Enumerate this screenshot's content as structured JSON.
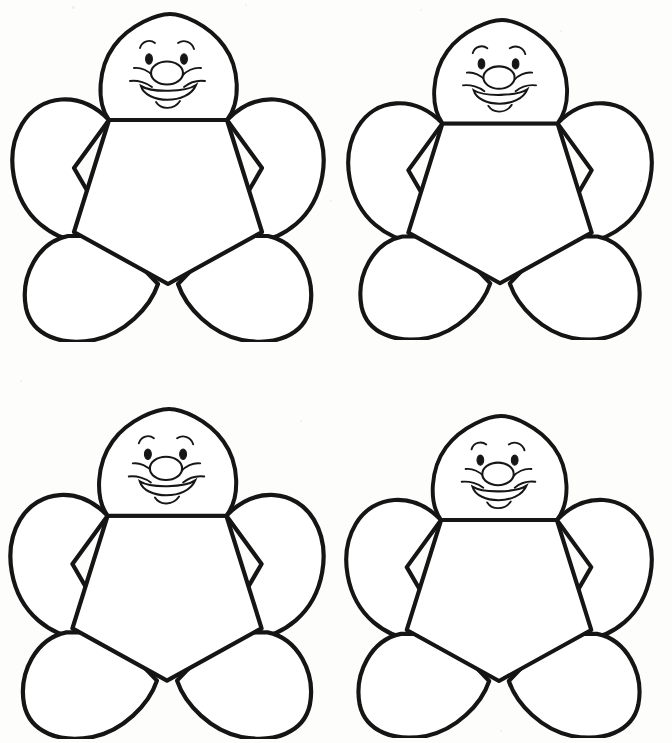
{
  "page": {
    "background_color": "#fdfdfc",
    "ink_color": "#151515",
    "width": 672,
    "height": 743,
    "layout": "2x2 grid of identical printable flower outlines",
    "watermark_text": ""
  },
  "flowers": [
    {
      "id": "flower-top-left",
      "label": "Flower template 1",
      "position": "top-left",
      "x": 8,
      "y": 10,
      "width": 320,
      "height": 332,
      "scale": 1.0,
      "petal_count": 5,
      "has_face": true
    },
    {
      "id": "flower-top-right",
      "label": "Flower template 2",
      "position": "top-right",
      "x": 344,
      "y": 16,
      "width": 312,
      "height": 324,
      "scale": 0.975,
      "petal_count": 5,
      "has_face": true
    },
    {
      "id": "flower-bottom-left",
      "label": "Flower template 3",
      "position": "bottom-left",
      "x": 6,
      "y": 405,
      "width": 322,
      "height": 334,
      "scale": 1.005,
      "petal_count": 5,
      "has_face": true
    },
    {
      "id": "flower-bottom-right",
      "label": "Flower template 4",
      "position": "bottom-right",
      "x": 342,
      "y": 412,
      "width": 314,
      "height": 326,
      "scale": 0.98,
      "petal_count": 5,
      "has_face": true
    }
  ],
  "face": {
    "description": "Smiling cartoon face drawn on the top petal which serves as the head",
    "features": [
      "left-eyebrow",
      "right-eyebrow",
      "left-eye",
      "right-eye",
      "nose",
      "left-cheek-line",
      "right-cheek-line",
      "smiling-mouth",
      "chin-curve"
    ]
  },
  "geometry": {
    "head_shape": "circle flattened at bottom edge",
    "center_shape": "pentagon",
    "petal_shape": "rounded teardrop lobe",
    "petal_positions": [
      "top-head",
      "upper-left",
      "upper-right",
      "lower-left",
      "lower-right"
    ]
  }
}
